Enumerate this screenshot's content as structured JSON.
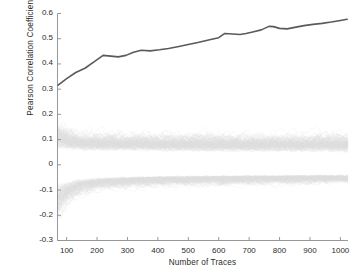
{
  "figure": {
    "background": "#ffffff",
    "width": 352,
    "height": 278
  },
  "chart_data": {
    "type": "line",
    "title": "",
    "subtitle": "",
    "xlabel": "Number of Traces",
    "ylabel": "Pearson Correlation Coefficient",
    "xlim": [
      70,
      1025
    ],
    "ylim": [
      -0.3,
      0.6
    ],
    "xticks": [
      100,
      200,
      300,
      400,
      500,
      600,
      700,
      800,
      900,
      1000
    ],
    "xticklabels": [
      "100",
      "200",
      "300",
      "400",
      "500",
      "600",
      "700",
      "800",
      "900",
      "1000"
    ],
    "yticks": [
      -0.3,
      -0.2,
      -0.1,
      0,
      0.1,
      0.2,
      0.3,
      0.4,
      0.5,
      0.6
    ],
    "yticklabels": [
      "-0.3",
      "-0.2",
      "-0.1",
      "0",
      "0.1",
      "0.2",
      "0.3",
      "0.4",
      "0.5",
      "0.6"
    ],
    "grid": false,
    "legend": null,
    "legend_position": "none",
    "annotations": [],
    "series": [
      {
        "name": "correct-key-hypothesis",
        "role": "highlighted",
        "color": "#5a5a5a",
        "linewidth": 1.6,
        "x": [
          72,
          100,
          130,
          160,
          190,
          220,
          245,
          270,
          295,
          320,
          345,
          375,
          405,
          435,
          465,
          500,
          535,
          570,
          600,
          620,
          645,
          670,
          690,
          715,
          740,
          765,
          780,
          800,
          825,
          850,
          880,
          910,
          940,
          970,
          1000,
          1022
        ],
        "y": [
          0.316,
          0.342,
          0.366,
          0.383,
          0.408,
          0.434,
          0.431,
          0.428,
          0.434,
          0.446,
          0.454,
          0.452,
          0.456,
          0.461,
          0.468,
          0.477,
          0.486,
          0.496,
          0.504,
          0.521,
          0.519,
          0.517,
          0.521,
          0.528,
          0.535,
          0.549,
          0.548,
          0.541,
          0.539,
          0.545,
          0.552,
          0.557,
          0.561,
          0.566,
          0.572,
          0.577
        ]
      },
      {
        "name": "incorrect-key-hypotheses",
        "role": "noise-band",
        "color": "#dcdcdc",
        "count": 255,
        "linewidth": 0.4,
        "description": "Dense bundle of 255 wrong-key correlation traces converging toward 0",
        "envelope": {
          "x": [
            72,
            90,
            110,
            140,
            170,
            210,
            260,
            320,
            400,
            500,
            620,
            750,
            880,
            1022
          ],
          "upper": [
            0.175,
            0.168,
            0.16,
            0.152,
            0.15,
            0.148,
            0.146,
            0.146,
            0.145,
            0.145,
            0.146,
            0.147,
            0.148,
            0.148
          ],
          "lower": [
            -0.212,
            -0.19,
            -0.168,
            -0.14,
            -0.124,
            -0.114,
            -0.107,
            -0.102,
            -0.098,
            -0.095,
            -0.093,
            -0.092,
            -0.091,
            -0.09
          ]
        },
        "core": {
          "x": [
            72,
            100,
            150,
            220,
            320,
            450,
            600,
            780,
            1022
          ],
          "upper": [
            0.11,
            0.105,
            0.1,
            0.098,
            0.096,
            0.095,
            0.094,
            0.094,
            0.094
          ],
          "lower": [
            -0.12,
            -0.11,
            -0.098,
            -0.09,
            -0.084,
            -0.08,
            -0.077,
            -0.075,
            -0.074
          ]
        }
      }
    ]
  },
  "axes": {
    "spines": {
      "left": true,
      "bottom": true,
      "top": false,
      "right": false
    },
    "spine_color": "#8c8c8c",
    "tick_color": "#8c8c8c",
    "tick_direction": "in",
    "tick_length": 3.5
  }
}
